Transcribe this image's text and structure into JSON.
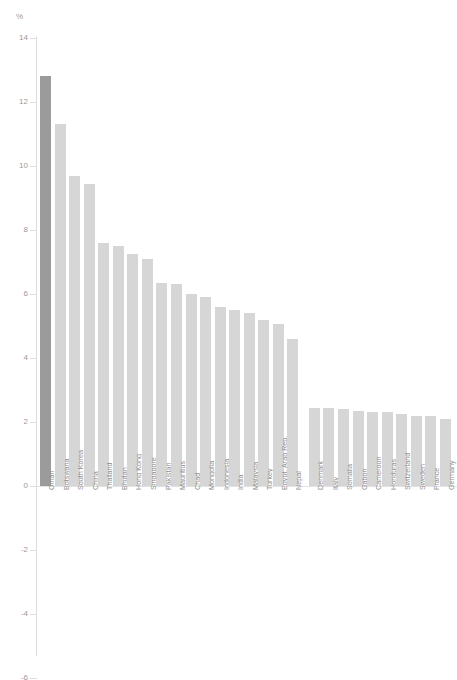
{
  "page": {
    "clipped_header_text": "",
    "background": "#ffffff"
  },
  "axis": {
    "unit_label": "%",
    "y_ticks": [
      "14",
      "12",
      "10",
      "8",
      "6",
      "4",
      "2",
      "0",
      "-2",
      "-4",
      "-6"
    ]
  },
  "colors": {
    "bar": "#d6d6d6",
    "bar_highlight": "#9b9b9b",
    "axis": "#dedede",
    "text": "#8f8f8f"
  },
  "chart_data": {
    "type": "bar",
    "title": "",
    "subtitle": "",
    "xlabel": "",
    "ylabel": "%",
    "ylim": [
      -6,
      14
    ],
    "ytick_step": 2,
    "grid": false,
    "legend": "none",
    "highlight_category": "Oman",
    "categories": [
      "Oman",
      "Botswana",
      "South Korea",
      "China",
      "Thailand",
      "Bhutan",
      "Hong Kong",
      "Singapore",
      "Pakistan",
      "Mauritius",
      "Chad",
      "Mongolia",
      "Indonesia",
      "India",
      "Malaysia",
      "Turkey",
      "Egypt, Arab Rep.",
      "Nepal",
      "Denmark",
      "Italy",
      "Somalia",
      "Gabon",
      "Cameroon",
      "Honduras",
      "Switzerland",
      "Sweden",
      "France",
      "Germany"
    ],
    "values": [
      12.8,
      11.3,
      9.7,
      9.45,
      7.6,
      7.5,
      7.25,
      7.1,
      6.35,
      6.3,
      6.0,
      5.9,
      5.6,
      5.5,
      5.4,
      5.2,
      5.05,
      4.6,
      2.45,
      2.45,
      2.4,
      2.35,
      2.3,
      2.3,
      2.25,
      2.2,
      2.2,
      2.1
    ],
    "group_break_after_index": 17
  }
}
